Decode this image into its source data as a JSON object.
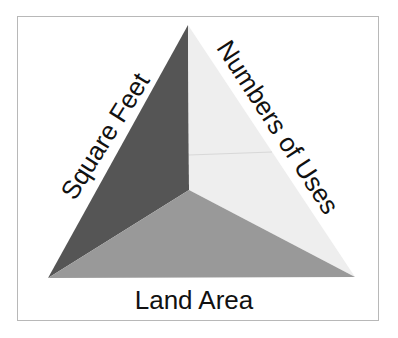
{
  "diagram": {
    "type": "triangle",
    "labels": {
      "left": "Square Feet",
      "right": "Numbers of Uses",
      "bottom": "Land Area"
    },
    "faces": {
      "left_color": "#555555",
      "right_color": "#eeeeee",
      "bottom_color": "#999999"
    }
  }
}
